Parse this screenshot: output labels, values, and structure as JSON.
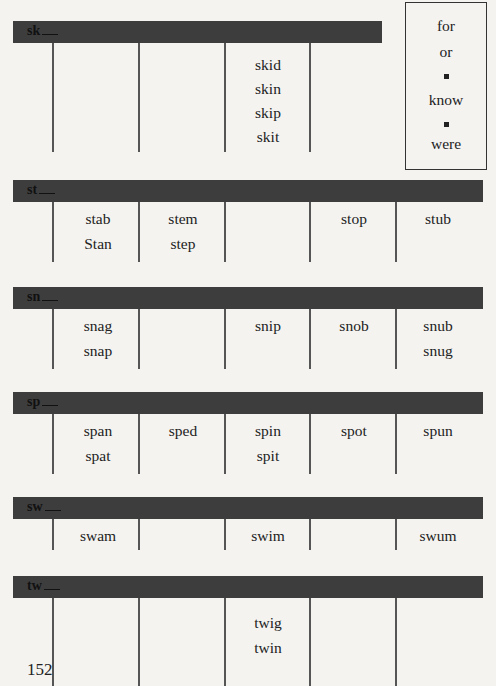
{
  "side_box": {
    "items": [
      "for",
      "or",
      "■",
      "know",
      "■",
      "were"
    ]
  },
  "sections": [
    {
      "label": "sk",
      "columns": [
        [],
        [],
        [
          "skid",
          "skin",
          "skip",
          "skit"
        ],
        []
      ]
    },
    {
      "label": "st",
      "columns": [
        [
          "stab",
          "Stan"
        ],
        [
          "stem",
          "step"
        ],
        [],
        [
          "stop"
        ],
        [
          "stub"
        ]
      ]
    },
    {
      "label": "sn",
      "columns": [
        [
          "snag",
          "snap"
        ],
        [],
        [
          "snip"
        ],
        [
          "snob"
        ],
        [
          "snub",
          "snug"
        ]
      ]
    },
    {
      "label": "sp",
      "columns": [
        [
          "span",
          "spat"
        ],
        [
          "sped"
        ],
        [
          "spin",
          "spit"
        ],
        [
          "spot"
        ],
        [
          "spun"
        ]
      ]
    },
    {
      "label": "sw",
      "columns": [
        [
          "swam"
        ],
        [],
        [
          "swim"
        ],
        [],
        [
          "swum"
        ]
      ]
    },
    {
      "label": "tw",
      "columns": [
        [],
        [],
        [
          "twig",
          "twin"
        ],
        [],
        []
      ]
    }
  ],
  "page_number": "152"
}
